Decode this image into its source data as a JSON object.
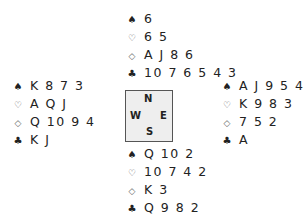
{
  "suit_symbols": {
    "spades": "♠",
    "hearts": "♡",
    "diamonds": "◇",
    "clubs": "♣"
  },
  "hands": {
    "north": {
      "spades": "6",
      "hearts": "6 5",
      "diamonds": "A J 8 6",
      "clubs": "10 7 6 5 4 3"
    },
    "west": {
      "spades": "K 8 7 3",
      "hearts": "A Q J",
      "diamonds": "Q 10 9 4",
      "clubs": "K J"
    },
    "east": {
      "spades": "A J 9 5 4",
      "hearts": "K 9 8 3",
      "diamonds": "7 5 2",
      "clubs": "A"
    },
    "south": {
      "spades": "Q 10 2",
      "hearts": "10 7 4 2",
      "diamonds": "K 3",
      "clubs": "Q 9 8 2"
    }
  },
  "compass": {
    "n": "N",
    "s": "S",
    "e": "E",
    "w": "W"
  }
}
